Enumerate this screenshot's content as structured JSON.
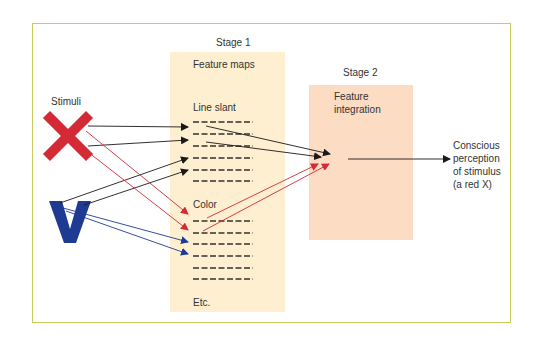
{
  "diagram": {
    "stimuli_label": "Stimuli",
    "stimuli": [
      {
        "name": "red X",
        "glyph": "X",
        "color": "#d42a36"
      },
      {
        "name": "blue V",
        "glyph": "V",
        "color": "#1f3a93"
      }
    ],
    "stage1": {
      "title": "Stage 1",
      "heading": "Feature maps",
      "groups": [
        {
          "label": "Line slant",
          "rows": 6
        },
        {
          "label": "Color",
          "rows": 6
        }
      ],
      "footer": "Etc.",
      "bg_color": "#fdefcf"
    },
    "stage2": {
      "title": "Stage 2",
      "heading_line1": "Feature",
      "heading_line2": "integration",
      "bg_color": "#fcdcc3"
    },
    "output": {
      "line1": "Conscious",
      "line2": "perception",
      "line3": "of stimulus",
      "line4": "(a red X)"
    },
    "colors": {
      "frame_border": "#c9cc5a",
      "arrow_black": "#1a1a1a",
      "arrow_red": "#d42a36",
      "arrow_blue": "#1f3a93"
    }
  }
}
